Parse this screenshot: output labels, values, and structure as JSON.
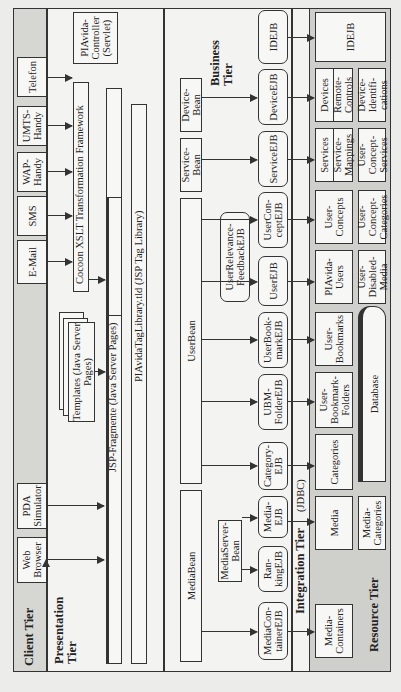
{
  "diagram": {
    "tiers": {
      "client": "Client Tier",
      "presentation": "Presentation Tier",
      "business": "Business Tier",
      "integration": "Integration Tier",
      "integration_sub": "(JDBC)",
      "resource": "Resource Tier"
    },
    "clients": [
      "Web Browser",
      "PDA Simulator",
      "E-Mail",
      "SMS",
      "WAP-Handy",
      "UMTS-Handy",
      "Telefon"
    ],
    "presentation": {
      "controller": "PIAvida-Controller (Servlet)",
      "cocoon": "Cocoon XSLT Transformation Framework",
      "templates": "Templates (Java Server Pages)",
      "jsp_fragment": "JSP-Fragmente (Java Server Pages)",
      "taglib": "PIAvidaTagLibrary.tld (JSP Tag Library)"
    },
    "beans": {
      "media": "MediaBean",
      "user": "UserBean",
      "service": "Service-Bean",
      "device": "Device-Bean",
      "mediaserver": "MediaServer-Bean"
    },
    "ejbs": {
      "mediacontainer": "MediaCon-tainerEJB",
      "ranking": "Ran-kingEJB",
      "media": "Media-EJB",
      "category": "Category-EJB",
      "ubmfolder": "UBM-FolderEJB",
      "userbookmark": "UserBook-markEJB",
      "user": "UserEJB",
      "userrelevance": "UserRelevance-FeedbackEJB",
      "userconcept": "UserCon-ceptEJB",
      "service": "ServiceEJB",
      "device": "DeviceEJB",
      "id": "IDEJB"
    },
    "resources": {
      "row1": [
        "Media-Containers",
        "Media",
        "Categories",
        "User-Bookmark-Folders",
        "User-Bookmarks",
        "PIAvida-Users",
        "User-Concepts",
        "Services",
        "Service-Mappings",
        "Devices",
        "Remote-Controls",
        "IDEJB"
      ],
      "row2": [
        "Media-Categories",
        "Database",
        "User-Disabled-Media",
        "User-Concept-Categories",
        "User-Concept-Services",
        "Device-Identifi-cations"
      ]
    }
  }
}
